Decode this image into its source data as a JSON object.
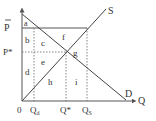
{
  "diagram": {
    "type": "supply-demand-price-ceiling",
    "axes": {
      "y_label": "P",
      "x_label": "Q",
      "origin_label": "0"
    },
    "curves": {
      "supply_label": "S",
      "demand_label": "D"
    },
    "price_levels": {
      "price_floor_label": "P̄",
      "equilibrium_price_label": "P*"
    },
    "quantity_levels": {
      "qd_label": "Q",
      "qd_sub": "d",
      "qstar_label": "Q*",
      "qs_label": "Q",
      "qs_sub": "S"
    },
    "regions": {
      "a": "a",
      "b": "b",
      "c": "c",
      "d": "d",
      "e": "e",
      "f": "f",
      "g": "g",
      "h": "h",
      "i": "i"
    },
    "colors": {
      "line": "#444444",
      "text": "#333333",
      "background": "#ffffff"
    }
  }
}
